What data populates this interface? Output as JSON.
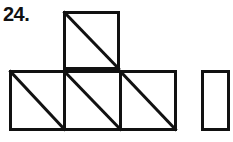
{
  "figure": {
    "problem_number": "24.",
    "caption": "",
    "background_color": "#ffffff",
    "stroke_color": "#111111",
    "stroke_width": 3,
    "label_color": "#111111"
  },
  "diagram": {
    "type": "geometric-net",
    "unit_size": 57,
    "shapes": [
      {
        "id": "top-square",
        "name": "top-square",
        "x": 63,
        "y": 11,
        "width": 57,
        "height": 59,
        "diagonal": "top-left-to-bottom-right"
      },
      {
        "id": "bottom-left-square",
        "name": "bottom-left-square",
        "x": 9,
        "y": 70,
        "width": 54,
        "height": 61,
        "diagonal": "top-left-to-bottom-right"
      },
      {
        "id": "bottom-middle-square",
        "name": "bottom-middle-square",
        "x": 63,
        "y": 70,
        "width": 57,
        "height": 61,
        "diagonal": "top-left-to-bottom-right"
      },
      {
        "id": "bottom-right-square",
        "name": "bottom-right-square",
        "x": 120,
        "y": 70,
        "width": 57,
        "height": 61,
        "diagonal": "top-left-to-bottom-right"
      },
      {
        "id": "separate-rectangle",
        "name": "separate-rectangle",
        "x": 201,
        "y": 70,
        "width": 27,
        "height": 61,
        "diagonal": "none"
      }
    ],
    "counts": {
      "squares_with_diagonals": 4,
      "plain_rectangles": 1,
      "total_shapes": 5
    }
  }
}
